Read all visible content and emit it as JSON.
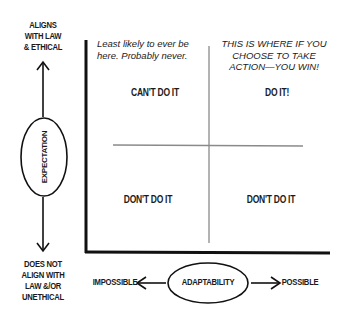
{
  "y_axis": {
    "label": "EXPECTATION",
    "top_label": [
      "ALIGNS",
      "WITH LAW",
      "& ETHICAL"
    ],
    "bottom_label": [
      "DOES NOT",
      "ALIGN WITH",
      "LAW &/OR",
      "UNETHICAL"
    ]
  },
  "x_axis": {
    "label": "ADAPTABILITY",
    "left_label": "IMPOSSIBLE",
    "right_label": "POSSIBLE"
  },
  "quadrants": {
    "top_left": {
      "note": [
        "Least likely to ever be",
        "here. Probably never."
      ],
      "label": "CAN'T DO IT"
    },
    "top_right": {
      "note": [
        "THIS IS WHERE IF YOU",
        "CHOOSE TO TAKE",
        "ACTION—YOU WIN!"
      ],
      "label": "DO IT!"
    },
    "bottom_left": {
      "label": "DON'T DO IT"
    },
    "bottom_right": {
      "label": "DON'T DO IT"
    }
  },
  "colors": {
    "axis": "#111111",
    "grid": "#8a8a8a",
    "text": "#1a1a1a"
  }
}
